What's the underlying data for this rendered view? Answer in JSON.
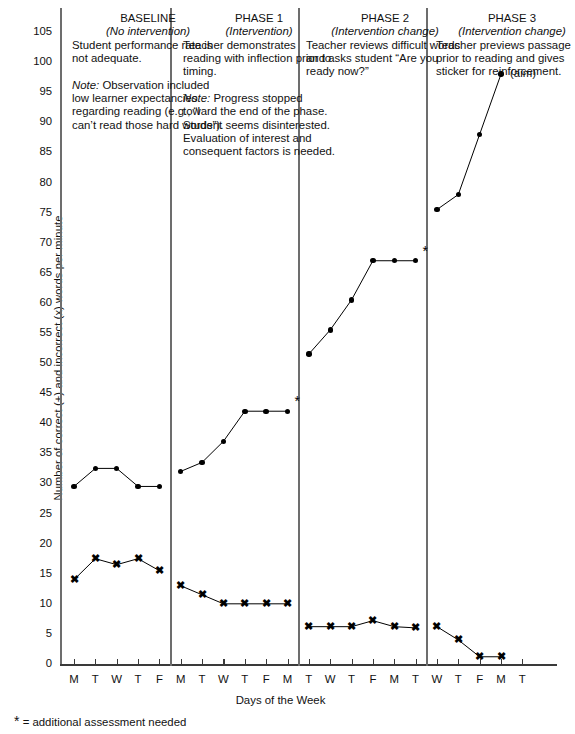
{
  "chart_data": {
    "type": "line",
    "title": "",
    "xlabel": "Days of the Week",
    "ylabel": "Number of correct (+) and incorrect (x) words per minute",
    "ylim": [
      0,
      107
    ],
    "yticks": [
      0,
      5,
      10,
      15,
      20,
      25,
      30,
      35,
      40,
      45,
      50,
      55,
      60,
      65,
      70,
      75,
      80,
      85,
      90,
      95,
      100,
      105
    ],
    "grid": false,
    "legend": "none",
    "x_labels": [
      "M",
      "T",
      "W",
      "T",
      "F",
      "M",
      "T",
      "W",
      "T",
      "F",
      "M",
      "T",
      "W",
      "T",
      "F",
      "M",
      "T",
      "W",
      "T",
      "F",
      "M",
      "T"
    ],
    "x_count": 22,
    "phase_breaks": [
      5,
      11,
      17
    ],
    "series": [
      {
        "name": "correct",
        "marker": "dot",
        "segments": [
          {
            "phase": "baseline",
            "x": [
              0,
              1,
              2,
              3,
              4
            ],
            "values": [
              29.5,
              32.5,
              32.5,
              29.5,
              29.5
            ]
          },
          {
            "phase": "phase1",
            "x": [
              5,
              6,
              7,
              8,
              9,
              10
            ],
            "values": [
              32,
              33.5,
              37,
              42,
              42,
              42
            ]
          },
          {
            "phase": "phase2",
            "x": [
              11,
              12,
              13,
              14,
              15,
              16
            ],
            "values": [
              51.5,
              55.5,
              60.5,
              67,
              67,
              67
            ]
          },
          {
            "phase": "phase3",
            "x": [
              17,
              18,
              19,
              20
            ],
            "values": [
              75.5,
              78,
              88,
              98
            ]
          }
        ]
      },
      {
        "name": "incorrect",
        "marker": "x",
        "segments": [
          {
            "phase": "baseline",
            "x": [
              0,
              1,
              2,
              3,
              4
            ],
            "values": [
              14,
              17.5,
              16.5,
              17.5,
              15.5
            ]
          },
          {
            "phase": "phase1",
            "x": [
              5,
              6,
              7,
              8,
              9,
              10
            ],
            "values": [
              13,
              11.5,
              10,
              10,
              10,
              10
            ]
          },
          {
            "phase": "phase2",
            "x": [
              11,
              12,
              13,
              14,
              15,
              16
            ],
            "values": [
              6.2,
              6.2,
              6.2,
              7.2,
              6.2,
              6
            ]
          },
          {
            "phase": "phase3",
            "x": [
              17,
              18,
              19,
              20
            ],
            "values": [
              6.2,
              4,
              1.2,
              1.2
            ]
          }
        ]
      }
    ],
    "annotations": [
      {
        "label": "*",
        "x": 10,
        "y": 42,
        "name": "phase1-asterisk"
      },
      {
        "label": "*",
        "x": 16,
        "y": 67,
        "name": "phase2-asterisk"
      },
      {
        "label": "(aim)",
        "x": 20,
        "y": 98,
        "name": "aim-label"
      }
    ]
  },
  "phases": [
    {
      "id": "baseline",
      "title": "BASELINE",
      "subtitle": "(No intervention)",
      "body": "Student performance rate is not adequate.",
      "note_lead": "Note:",
      "note_body": " Observation included low learner expectancies regarding reading (e.g., “I can’t read those hard words”)."
    },
    {
      "id": "phase1",
      "title": "PHASE 1",
      "subtitle": "(Intervention)",
      "body": "Teacher demonstrates reading with inflection prior to timing.",
      "note_lead": "Note:",
      "note_body": " Progress stopped toward the end of the phase. Student seems disinterested. Evaluation of interest and consequent factors is needed."
    },
    {
      "id": "phase2",
      "title": "PHASE 2",
      "subtitle": "(Intervention change)",
      "body": "Teacher reviews difficult words and asks student “Are you ready now?”",
      "note_lead": "",
      "note_body": ""
    },
    {
      "id": "phase3",
      "title": "PHASE 3",
      "subtitle": "(Intervention change)",
      "body": "Teacher previews passage prior to reading and gives sticker for reinforcement.",
      "note_lead": "",
      "note_body": ""
    }
  ],
  "footnote": {
    "star": "*",
    "text": "= additional assessment needed"
  },
  "colors": {
    "ink": "#000000",
    "axis": "#6d6d6d",
    "background": "#ffffff"
  }
}
